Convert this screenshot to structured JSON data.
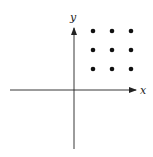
{
  "diagram": {
    "type": "coordinate-plane",
    "x_axis_label": "x",
    "y_axis_label": "y",
    "colors": {
      "axis": "#222222",
      "dot": "#111111",
      "background": "#ffffff"
    },
    "grid_points": {
      "rows": 3,
      "cols": 3,
      "quadrant": "I",
      "points": [
        {
          "col": 1,
          "row": 1
        },
        {
          "col": 2,
          "row": 1
        },
        {
          "col": 3,
          "row": 1
        },
        {
          "col": 1,
          "row": 2
        },
        {
          "col": 2,
          "row": 2
        },
        {
          "col": 3,
          "row": 2
        },
        {
          "col": 1,
          "row": 3
        },
        {
          "col": 2,
          "row": 3
        },
        {
          "col": 3,
          "row": 3
        }
      ]
    }
  }
}
